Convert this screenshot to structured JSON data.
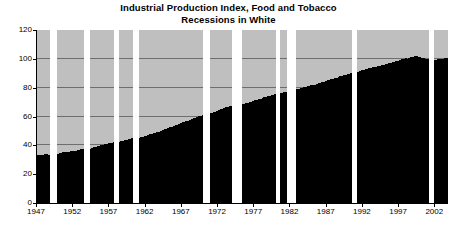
{
  "chart_data": {
    "type": "bar",
    "title": "Industrial Production Index, Food and Tobacco",
    "subtitle": "Recessions in White",
    "xlabel": "",
    "ylabel": "",
    "ylim": [
      0,
      120
    ],
    "yticks": [
      0,
      20,
      40,
      60,
      80,
      100,
      120
    ],
    "ytick_labels": [
      "0",
      "20",
      "40",
      "60",
      "80",
      "100",
      "120"
    ],
    "xlim": [
      1947,
      2003.75
    ],
    "xticks": [
      1947,
      1952,
      1957,
      1962,
      1967,
      1972,
      1977,
      1982,
      1987,
      1992,
      1997,
      2002
    ],
    "xtick_labels": [
      "1947",
      "1952",
      "1957",
      "1962",
      "1967",
      "1972",
      "1977",
      "1982",
      "1987",
      "1992",
      "1997",
      "2002"
    ],
    "grid": true,
    "legend": false,
    "bar_color": "#000000",
    "plot_background": "#bfbfbf",
    "recession_color": "#ffffff",
    "series_name": "Industrial Production Index, Food and Tobacco",
    "x": [
      1947.0,
      1947.25,
      1947.5,
      1947.75,
      1948.0,
      1948.25,
      1948.5,
      1948.75,
      1949.0,
      1949.25,
      1949.5,
      1949.75,
      1950.0,
      1950.25,
      1950.5,
      1950.75,
      1951.0,
      1951.25,
      1951.5,
      1951.75,
      1952.0,
      1952.25,
      1952.5,
      1952.75,
      1953.0,
      1953.25,
      1953.5,
      1953.75,
      1954.0,
      1954.25,
      1954.5,
      1954.75,
      1955.0,
      1955.25,
      1955.5,
      1955.75,
      1956.0,
      1956.25,
      1956.5,
      1956.75,
      1957.0,
      1957.25,
      1957.5,
      1957.75,
      1958.0,
      1958.25,
      1958.5,
      1958.75,
      1959.0,
      1959.25,
      1959.5,
      1959.75,
      1960.0,
      1960.25,
      1960.5,
      1960.75,
      1961.0,
      1961.25,
      1961.5,
      1961.75,
      1962.0,
      1962.25,
      1962.5,
      1962.75,
      1963.0,
      1963.25,
      1963.5,
      1963.75,
      1964.0,
      1964.25,
      1964.5,
      1964.75,
      1965.0,
      1965.25,
      1965.5,
      1965.75,
      1966.0,
      1966.25,
      1966.5,
      1966.75,
      1967.0,
      1967.25,
      1967.5,
      1967.75,
      1968.0,
      1968.25,
      1968.5,
      1968.75,
      1969.0,
      1969.25,
      1969.5,
      1969.75,
      1970.0,
      1970.25,
      1970.5,
      1970.75,
      1971.0,
      1971.25,
      1971.5,
      1971.75,
      1972.0,
      1972.25,
      1972.5,
      1972.75,
      1973.0,
      1973.25,
      1973.5,
      1973.75,
      1974.0,
      1974.25,
      1974.5,
      1974.75,
      1975.0,
      1975.25,
      1975.5,
      1975.75,
      1976.0,
      1976.25,
      1976.5,
      1976.75,
      1977.0,
      1977.25,
      1977.5,
      1977.75,
      1978.0,
      1978.25,
      1978.5,
      1978.75,
      1979.0,
      1979.25,
      1979.5,
      1979.75,
      1980.0,
      1980.25,
      1980.5,
      1980.75,
      1981.0,
      1981.25,
      1981.5,
      1981.75,
      1982.0,
      1982.25,
      1982.5,
      1982.75,
      1983.0,
      1983.25,
      1983.5,
      1983.75,
      1984.0,
      1984.25,
      1984.5,
      1984.75,
      1985.0,
      1985.25,
      1985.5,
      1985.75,
      1986.0,
      1986.25,
      1986.5,
      1986.75,
      1987.0,
      1987.25,
      1987.5,
      1987.75,
      1988.0,
      1988.25,
      1988.5,
      1988.75,
      1989.0,
      1989.25,
      1989.5,
      1989.75,
      1990.0,
      1990.25,
      1990.5,
      1990.75,
      1991.0,
      1991.25,
      1991.5,
      1991.75,
      1992.0,
      1992.25,
      1992.5,
      1992.75,
      1993.0,
      1993.25,
      1993.5,
      1993.75,
      1994.0,
      1994.25,
      1994.5,
      1994.75,
      1995.0,
      1995.25,
      1995.5,
      1995.75,
      1996.0,
      1996.25,
      1996.5,
      1996.75,
      1997.0,
      1997.25,
      1997.5,
      1997.75,
      1998.0,
      1998.25,
      1998.5,
      1998.75,
      1999.0,
      1999.25,
      1999.5,
      1999.75,
      2000.0,
      2000.25,
      2000.5,
      2000.75,
      2001.0,
      2001.25,
      2001.5,
      2001.75,
      2002.0,
      2002.25,
      2002.5,
      2002.75,
      2003.0,
      2003.25,
      2003.5
    ],
    "values": [
      33.0,
      33.4,
      33.2,
      33.6,
      33.8,
      34.0,
      33.6,
      33.4,
      33.2,
      33.6,
      34.0,
      34.2,
      34.6,
      35.0,
      35.4,
      35.6,
      35.2,
      35.4,
      35.8,
      36.0,
      36.2,
      36.4,
      36.8,
      37.0,
      37.4,
      37.6,
      37.4,
      37.2,
      37.4,
      37.8,
      38.2,
      38.6,
      39.0,
      39.4,
      39.6,
      40.0,
      40.4,
      40.6,
      41.0,
      41.4,
      41.6,
      41.8,
      42.0,
      41.8,
      42.0,
      42.4,
      42.8,
      43.2,
      43.6,
      44.0,
      44.2,
      44.6,
      45.0,
      45.2,
      45.0,
      44.8,
      45.2,
      45.6,
      46.0,
      46.4,
      46.8,
      47.2,
      47.6,
      48.0,
      48.4,
      48.8,
      49.2,
      49.6,
      50.0,
      50.6,
      51.0,
      51.4,
      52.0,
      52.6,
      53.0,
      53.6,
      54.0,
      54.4,
      55.0,
      55.4,
      56.0,
      56.4,
      56.8,
      57.2,
      57.8,
      58.4,
      58.8,
      59.2,
      59.8,
      60.2,
      60.6,
      61.0,
      61.4,
      61.8,
      62.0,
      62.2,
      62.6,
      63.0,
      63.4,
      64.0,
      64.4,
      65.0,
      65.4,
      66.0,
      66.4,
      66.8,
      67.0,
      67.2,
      67.0,
      67.4,
      67.6,
      67.8,
      68.0,
      68.4,
      68.8,
      69.2,
      69.6,
      70.0,
      70.4,
      70.8,
      71.2,
      71.6,
      72.0,
      72.4,
      72.8,
      73.2,
      73.6,
      74.0,
      74.4,
      74.8,
      75.2,
      75.6,
      76.0,
      76.2,
      76.0,
      76.4,
      76.8,
      77.0,
      77.2,
      77.4,
      77.6,
      78.0,
      78.4,
      78.8,
      79.2,
      79.6,
      80.0,
      80.4,
      80.8,
      81.2,
      81.4,
      81.6,
      81.8,
      82.2,
      82.6,
      83.0,
      83.4,
      83.8,
      84.2,
      84.6,
      85.0,
      85.4,
      85.8,
      86.2,
      86.6,
      87.0,
      87.4,
      87.8,
      88.2,
      88.6,
      89.0,
      89.4,
      89.8,
      90.2,
      90.6,
      90.8,
      91.0,
      91.2,
      91.6,
      92.0,
      92.4,
      92.8,
      93.2,
      93.6,
      93.8,
      94.2,
      94.0,
      94.4,
      94.8,
      95.2,
      95.6,
      96.0,
      96.2,
      96.6,
      97.0,
      97.2,
      97.6,
      98.0,
      98.4,
      98.8,
      99.2,
      99.6,
      100.0,
      100.4,
      100.2,
      100.6,
      101.0,
      101.4,
      101.8,
      102.0,
      101.6,
      101.2,
      100.8,
      100.4,
      100.0,
      99.6,
      99.2,
      99.0,
      98.8,
      99.0,
      99.4,
      99.6,
      99.8,
      100.0,
      100.2,
      100.4,
      100.6
    ],
    "recessions": [
      {
        "label": "1948-1949",
        "start": 1948.83,
        "end": 1949.83
      },
      {
        "label": "1953-1954",
        "start": 1953.5,
        "end": 1954.33
      },
      {
        "label": "1957-1958",
        "start": 1957.58,
        "end": 1958.33
      },
      {
        "label": "1960-1961",
        "start": 1960.25,
        "end": 1961.08
      },
      {
        "label": "1969-1970",
        "start": 1969.92,
        "end": 1970.83
      },
      {
        "label": "1973-1975",
        "start": 1973.92,
        "end": 1975.25
      },
      {
        "label": "1980",
        "start": 1980.0,
        "end": 1980.5
      },
      {
        "label": "1981-1982",
        "start": 1981.5,
        "end": 1982.83
      },
      {
        "label": "1990-1991",
        "start": 1990.5,
        "end": 1991.17
      },
      {
        "label": "2001",
        "start": 2001.17,
        "end": 2001.83
      }
    ]
  }
}
